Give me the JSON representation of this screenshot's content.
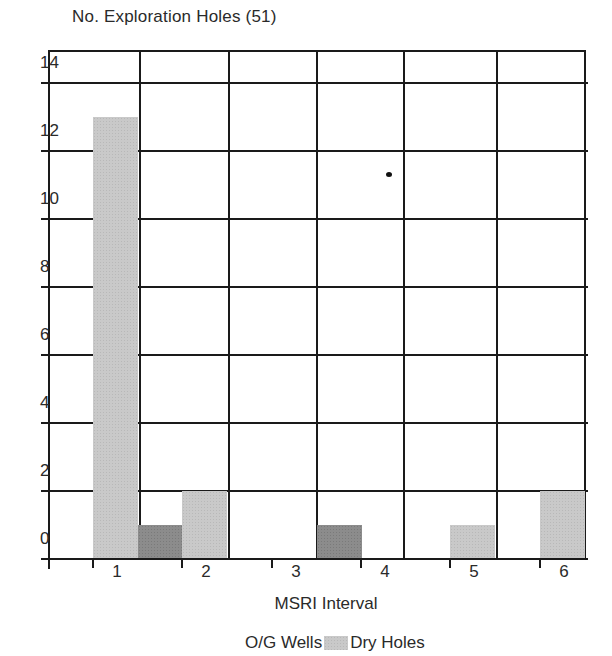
{
  "chart_data": {
    "type": "bar",
    "title": "No. Exploration Holes (51)",
    "xlabel": "MSRI Interval",
    "ylabel": "",
    "categories": [
      "1",
      "2",
      "3",
      "4",
      "5",
      "6"
    ],
    "series": [
      {
        "name": "Dry Holes",
        "values": [
          13,
          2,
          0,
          0,
          1,
          2
        ],
        "color": "#c9c9c9"
      },
      {
        "name": "O/G Wells",
        "values": [
          1,
          0,
          1,
          0,
          0,
          0
        ],
        "color": "#8c8c8c"
      }
    ],
    "yticks": [
      0,
      2,
      4,
      6,
      8,
      10,
      12,
      14
    ],
    "ylim": [
      0,
      15
    ],
    "grid": true,
    "legend_position": "bottom"
  },
  "labels": {
    "title": "No. Exploration Holes (51)",
    "xlabel": "MSRI Interval",
    "legend_og": "O/G Wells",
    "legend_dry": "Dry Holes",
    "yticks": [
      "0",
      "2",
      "4",
      "6",
      "8",
      "10",
      "12",
      "14"
    ],
    "xticks": [
      "1",
      "2",
      "3",
      "4",
      "5",
      "6"
    ]
  }
}
